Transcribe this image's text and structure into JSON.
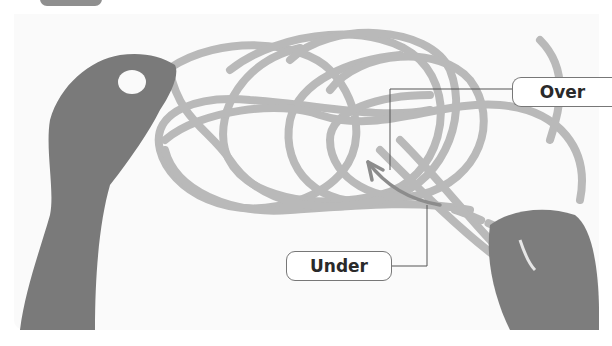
{
  "figure": {
    "palette": {
      "rope": "#b9b9b9",
      "skin": "#7a7a7a",
      "arrow": "#8c8c8c",
      "leader_line": "#555555",
      "label_border": "#777777",
      "label_text": "#2a2a2a"
    }
  },
  "callouts": {
    "over": {
      "label": "Over"
    },
    "under": {
      "label": "Under"
    }
  }
}
